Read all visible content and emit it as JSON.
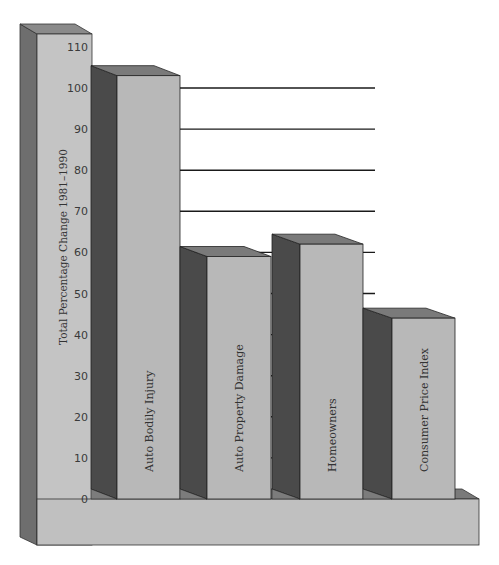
{
  "chart_data": {
    "type": "bar",
    "style": "3d",
    "title": "",
    "xlabel": "",
    "ylabel": "Total Percentage Change 1981–1990",
    "categories": [
      "Auto Bodily Injury",
      "Auto Property Damage",
      "Homeowners",
      "Consumer Price Index"
    ],
    "values": [
      103,
      59,
      62,
      44
    ],
    "ylim": [
      0,
      110
    ],
    "yticks": [
      0,
      10,
      20,
      30,
      40,
      50,
      60,
      70,
      80,
      90,
      100,
      110
    ],
    "grid": true,
    "legend": null,
    "label_position": "vertical text inside each bar"
  },
  "colors": {
    "front_face": "#b8b8b8",
    "side_face": "#4a4a4a",
    "top_face": "#7a7a7a",
    "axis_column_front": "#c4c4c4",
    "axis_column_side": "#6e6e6e",
    "base": "#c0c0c0",
    "gridline": "#1a1a1a",
    "background": "#ffffff"
  }
}
